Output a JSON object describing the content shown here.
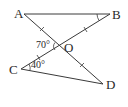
{
  "diagram": {
    "type": "geometry",
    "points": {
      "A": {
        "label": "A"
      },
      "B": {
        "label": "B"
      },
      "C": {
        "label": "C"
      },
      "D": {
        "label": "D"
      },
      "O": {
        "label": "O"
      }
    },
    "segments": [
      "AB",
      "AD",
      "CB",
      "CD"
    ],
    "intersection": "O = AD ∩ CB",
    "equal_marks": [
      "AO",
      "OD",
      "CO",
      "OB"
    ],
    "angles": [
      {
        "name": "angle-AOC",
        "label": "70°"
      },
      {
        "name": "angle-OCD",
        "label": "40°"
      },
      {
        "name": "angle-ABO",
        "label": ""
      }
    ]
  }
}
